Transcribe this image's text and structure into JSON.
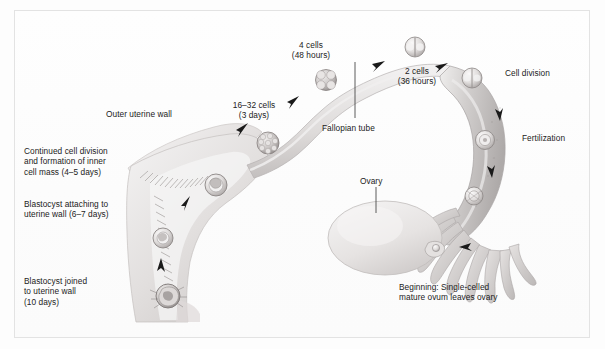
{
  "figure": {
    "type": "biological-process-diagram",
    "background_color": "#fdfdfd",
    "frame_color": "#e3e3e3",
    "text_color": "#1b1b1b",
    "tissue_tone_light": "#eceaea",
    "tissue_tone_mid": "#d6d3d2",
    "tissue_tone_dark": "#b9b5b4",
    "arrow_color": "#1a1a1a"
  },
  "labels": {
    "outer_uterine_wall": "Outer uterine wall",
    "continued_cell_division": "Continued cell division\nand formation of inner\ncell mass (4–5 days)",
    "blastocyst_attaching": "Blastocyst attaching to\nuterine wall (6–7 days)",
    "blastocyst_joined": "Blastocyst joined\nto uterine wall\n(10 days)",
    "cells_16_32": "16–32 cells\n(3 days)",
    "cells_4": "4 cells\n(48 hours)",
    "cells_2": "2 cells\n(36 hours)",
    "fallopian_tube": "Fallopian tube",
    "cell_division": "Cell division",
    "fertilization": "Fertilization",
    "ovary": "Ovary",
    "beginning": "Beginning: Single-celled\nmature ovum leaves ovary"
  },
  "stages": [
    {
      "order": 1,
      "name": "ovulation",
      "label": "Beginning: Single-celled mature ovum leaves ovary",
      "time": null
    },
    {
      "order": 2,
      "name": "fertilization",
      "label": "Fertilization",
      "time": null
    },
    {
      "order": 3,
      "name": "cell-division",
      "label": "Cell division",
      "time": null
    },
    {
      "order": 4,
      "name": "two-cell",
      "label": "2 cells",
      "time": "36 hours"
    },
    {
      "order": 5,
      "name": "four-cell",
      "label": "4 cells",
      "time": "48 hours"
    },
    {
      "order": 6,
      "name": "morula",
      "label": "16–32 cells",
      "time": "3 days"
    },
    {
      "order": 7,
      "name": "blastocyst-inner-cell-mass",
      "label": "Continued cell division and formation of inner cell mass",
      "time": "4–5 days"
    },
    {
      "order": 8,
      "name": "blastocyst-attaching",
      "label": "Blastocyst attaching to uterine wall",
      "time": "6–7 days"
    },
    {
      "order": 9,
      "name": "blastocyst-joined",
      "label": "Blastocyst joined to uterine wall",
      "time": "10 days"
    }
  ],
  "anatomy": [
    {
      "name": "ovary",
      "label": "Ovary"
    },
    {
      "name": "fimbriae",
      "label": null
    },
    {
      "name": "fallopian-tube",
      "label": "Fallopian tube"
    },
    {
      "name": "uterus",
      "label": null
    },
    {
      "name": "outer-uterine-wall",
      "label": "Outer uterine wall"
    },
    {
      "name": "endometrium",
      "label": null
    }
  ]
}
